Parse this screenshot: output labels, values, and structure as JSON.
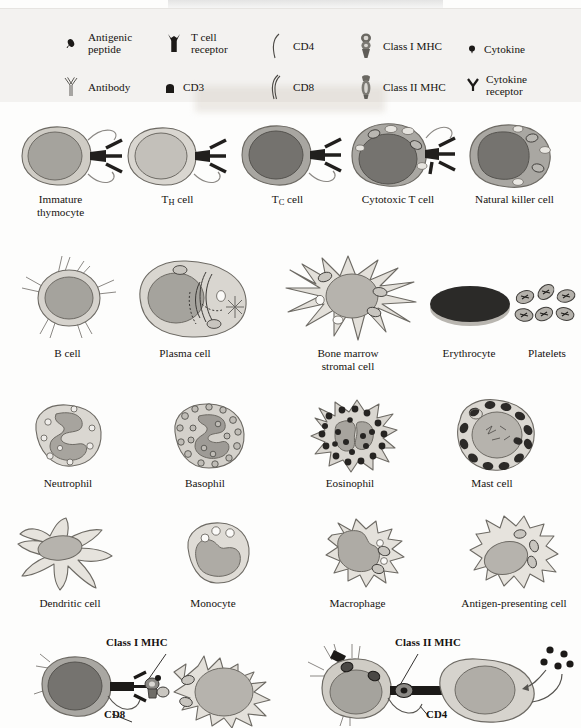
{
  "figure": {
    "kind": "immunology-cell-reference-plate",
    "background_color": "#fdfdfc",
    "legend_panel_color": "#f3f2f0",
    "ink_color": "#15120f",
    "cytoplasm_color": "#d8d5cf",
    "nucleus_color": "#9b9a95",
    "dark_nucleus_color": "#6f6e6b",
    "granule_dark_color": "#2f2d2b",
    "erythrocyte_color": "#2b2a28"
  },
  "legend": {
    "items": [
      {
        "label": "Antigenic\npeptide",
        "icon": "antigenic-peptide-icon",
        "x": 60,
        "y": 28
      },
      {
        "label": "T cell\nreceptor",
        "icon": "t-cell-receptor-icon",
        "x": 163,
        "y": 28
      },
      {
        "label": "CD4",
        "icon": "cd4-icon",
        "x": 265,
        "y": 31
      },
      {
        "label": "Class I MHC",
        "icon": "class-i-mhc-icon",
        "x": 355,
        "y": 31
      },
      {
        "label": "Cytokine",
        "icon": "cytokine-icon",
        "x": 466,
        "y": 34
      },
      {
        "label": "Antibody",
        "icon": "antibody-icon",
        "x": 60,
        "y": 72
      },
      {
        "label": "CD3",
        "icon": "cd3-icon",
        "x": 163,
        "y": 72
      },
      {
        "label": "CD8",
        "icon": "cd8-icon",
        "x": 265,
        "y": 72
      },
      {
        "label": "Class II MHC",
        "icon": "class-ii-mhc-icon",
        "x": 355,
        "y": 72
      },
      {
        "label": "Cytokine\nreceptor",
        "icon": "cytokine-receptor-icon",
        "x": 466,
        "y": 70
      }
    ]
  },
  "rows": [
    {
      "name": "t-lineage-row",
      "cells": [
        {
          "id": "immature-thymocyte",
          "label": "Immature\nthymocyte",
          "label_x": 13,
          "label_y": 193,
          "label_w": 95
        },
        {
          "id": "th-cell",
          "label_html": "T<sub>H</sub> cell",
          "label": "TH cell",
          "label_x": 130,
          "label_y": 193,
          "label_w": 95
        },
        {
          "id": "tc-cell",
          "label_html": "T<sub>C</sub> cell",
          "label": "TC cell",
          "label_x": 240,
          "label_y": 193,
          "label_w": 95
        },
        {
          "id": "cytotoxic-t-cell",
          "label": "Cytotoxic T cell",
          "label_x": 338,
          "label_y": 193,
          "label_w": 120
        },
        {
          "id": "natural-killer-cell",
          "label": "Natural killer cell",
          "label_x": 452,
          "label_y": 193,
          "label_w": 125
        }
      ]
    },
    {
      "name": "b-lineage-and-stroma-row",
      "cells": [
        {
          "id": "b-cell",
          "label": "B cell",
          "label_x": 20,
          "label_y": 347,
          "label_w": 95
        },
        {
          "id": "plasma-cell",
          "label": "Plasma cell",
          "label_x": 130,
          "label_y": 347,
          "label_w": 110
        },
        {
          "id": "bone-marrow-stromal-cell",
          "label": "Bone marrow\nstromal cell",
          "label_x": 293,
          "label_y": 347,
          "label_w": 110
        },
        {
          "id": "erythrocyte",
          "label": "Erythrocyte",
          "label_x": 424,
          "label_y": 347,
          "label_w": 90
        },
        {
          "id": "platelets",
          "label": "Platelets",
          "label_x": 512,
          "label_y": 347,
          "label_w": 70
        }
      ]
    },
    {
      "name": "granulocyte-row",
      "cells": [
        {
          "id": "neutrophil",
          "label": "Neutrophil",
          "label_x": 18,
          "label_y": 477,
          "label_w": 100
        },
        {
          "id": "basophil",
          "label": "Basophil",
          "label_x": 155,
          "label_y": 477,
          "label_w": 100
        },
        {
          "id": "eosinophil",
          "label": "Eosinophil",
          "label_x": 300,
          "label_y": 477,
          "label_w": 100
        },
        {
          "id": "mast-cell",
          "label": "Mast cell",
          "label_x": 442,
          "label_y": 477,
          "label_w": 100
        }
      ]
    },
    {
      "name": "mononuclear-phagocyte-row",
      "cells": [
        {
          "id": "dendritic-cell",
          "label": "Dendritic cell",
          "label_x": 15,
          "label_y": 597,
          "label_w": 110
        },
        {
          "id": "monocyte",
          "label": "Monocyte",
          "label_x": 163,
          "label_y": 597,
          "label_w": 100
        },
        {
          "id": "macrophage",
          "label": "Macrophage",
          "label_x": 305,
          "label_y": 597,
          "label_w": 105
        },
        {
          "id": "antigen-presenting-cell",
          "label": "Antigen-presenting cell",
          "label_x": 448,
          "label_y": 597,
          "label_w": 132
        }
      ]
    }
  ],
  "interactions": [
    {
      "id": "class-i-mhc-interaction",
      "top_label": "Class I MHC",
      "top_label_x": 106,
      "top_label_y": 636,
      "bottom_label": "CD8",
      "bottom_label_x": 104,
      "bottom_label_y": 710,
      "left_cell": "cytotoxic-t-cell",
      "right_cell": "target-cell"
    },
    {
      "id": "class-ii-mhc-interaction",
      "top_label": "Class II MHC",
      "top_label_x": 395,
      "top_label_y": 636,
      "bottom_label": "CD4",
      "bottom_label_x": 426,
      "bottom_label_y": 710,
      "left_cell": "th-cell",
      "right_cell": "antigen-presenting-cell"
    }
  ]
}
